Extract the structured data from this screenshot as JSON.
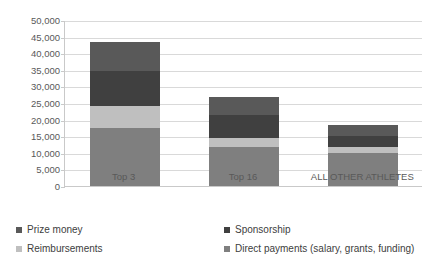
{
  "chart_data": {
    "type": "bar",
    "stacked": true,
    "orientation": "vertical",
    "title": "",
    "subtitle": "",
    "xlabel": "",
    "ylabel": "",
    "categories": [
      "Top 3",
      "Top 16",
      "ALL OTHER ATHLETES"
    ],
    "series": [
      {
        "name": "Direct payments (salary, grants, funding)",
        "color": "#7f7f7f",
        "values": [
          17500,
          11700,
          10000
        ]
      },
      {
        "name": "Reimbursements",
        "color": "#bfbfbf",
        "values": [
          6500,
          2800,
          1800
        ]
      },
      {
        "name": "Sponsorship",
        "color": "#404040",
        "values": [
          10500,
          7000,
          3200
        ]
      },
      {
        "name": "Prize money",
        "color": "#595959",
        "values": [
          8800,
          5200,
          3500
        ]
      }
    ],
    "stack_order_bottom_to_top": [
      "Direct payments (salary, grants, funding)",
      "Reimbursements",
      "Sponsorship",
      "Prize money"
    ],
    "totals": [
      43300,
      26700,
      18500
    ],
    "ylim": [
      0,
      50000
    ],
    "ytick_step": 5000,
    "yticks": [
      0,
      5000,
      10000,
      15000,
      20000,
      25000,
      30000,
      35000,
      40000,
      45000,
      50000
    ],
    "ytick_labels": [
      "0",
      "5,000",
      "10,000",
      "15,000",
      "20,000",
      "25,000",
      "30,000",
      "35,000",
      "40,000",
      "45,000",
      "50,000"
    ],
    "grid": true,
    "grid_axis": "y",
    "legend_position": "bottom",
    "legend_order": [
      "Prize money",
      "Sponsorship",
      "Reimbursements",
      "Direct payments (salary, grants, funding)"
    ],
    "annotations": []
  },
  "legend": {
    "items": [
      {
        "label": "Prize money",
        "color": "#595959"
      },
      {
        "label": "Sponsorship",
        "color": "#404040"
      },
      {
        "label": "Reimbursements",
        "color": "#bfbfbf"
      },
      {
        "label": "Direct payments (salary, grants, funding)",
        "color": "#7f7f7f"
      }
    ]
  },
  "axis": {
    "y_tick_labels": [
      "50,000",
      "45,000",
      "40,000",
      "35,000",
      "30,000",
      "25,000",
      "20,000",
      "15,000",
      "10,000",
      "5,000",
      "0"
    ],
    "x_tick_labels": [
      "Top 3",
      "Top 16",
      "ALL OTHER ATHLETES"
    ]
  },
  "colors": {
    "prize_money": "#595959",
    "sponsorship": "#404040",
    "reimbursements": "#bfbfbf",
    "direct_payments": "#7f7f7f",
    "gridline": "#d9d9d9",
    "axis": "#c9c9c9",
    "text": "#595959",
    "background": "#ffffff"
  }
}
